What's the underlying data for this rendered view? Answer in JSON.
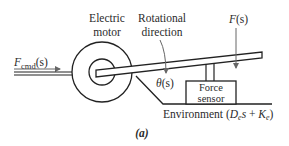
{
  "diagram": {
    "labels": {
      "motor_line1": "Electric",
      "motor_line2": "motor",
      "rotation_line1": "Rotational",
      "rotation_line2": "direction",
      "force_output": "F(s)",
      "force_output_var": "F",
      "force_output_arg": "(s)",
      "force_cmd_var": "F",
      "force_cmd_sub": "cmd",
      "force_cmd_arg": "(s)",
      "theta_var": "θ",
      "theta_arg": "(s)",
      "sensor_line1": "Force",
      "sensor_line2": "sensor",
      "environment_text": "Environment (",
      "env_D": "D",
      "env_D_sub": "e",
      "env_s": "s",
      "env_plus": " + ",
      "env_K": "K",
      "env_K_sub": "e",
      "env_close": ")",
      "caption": "(a)"
    },
    "colors": {
      "stroke": "#222222",
      "arrow": "#555555",
      "text": "#2b2b2b",
      "background": "#ffffff"
    }
  }
}
